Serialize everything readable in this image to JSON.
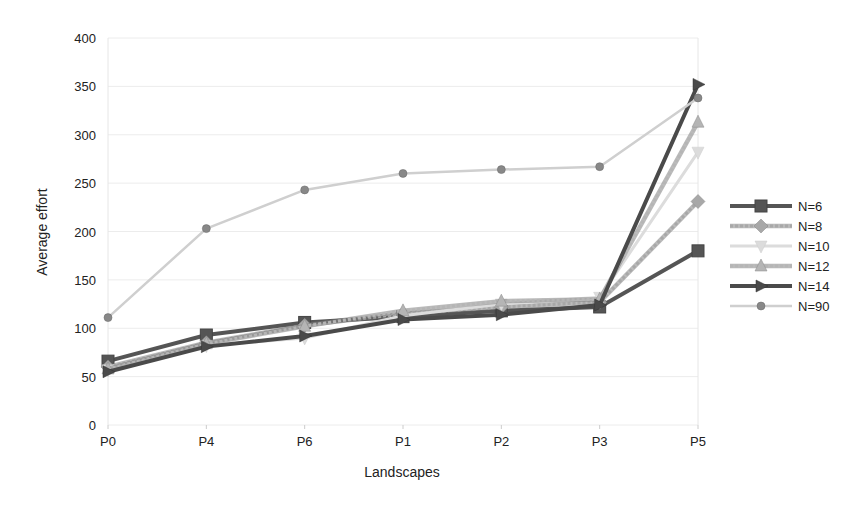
{
  "chart_data": {
    "type": "line",
    "title": "",
    "xlabel": "Landscapes",
    "ylabel": "Average effort",
    "categories": [
      "P0",
      "P4",
      "P6",
      "P1",
      "P2",
      "P3",
      "P5"
    ],
    "ylim": [
      0,
      400
    ],
    "yticks": [
      0,
      50,
      100,
      150,
      200,
      250,
      300,
      350,
      400
    ],
    "grid": true,
    "legend_position": "right",
    "series": [
      {
        "name": "N=6",
        "values": [
          66,
          93,
          106,
          112,
          118,
          122,
          180
        ],
        "color": "#555555",
        "dash": "",
        "width": 4,
        "marker": "square"
      },
      {
        "name": "N=8",
        "values": [
          60,
          85,
          103,
          115,
          122,
          127,
          231
        ],
        "color": "#a8a8a8",
        "dash": "3,2",
        "width": 3,
        "marker": "diamond"
      },
      {
        "name": "N=10",
        "values": [
          57,
          82,
          90,
          113,
          125,
          132,
          282
        ],
        "color": "#dcdcdc",
        "dash": "",
        "width": 3,
        "marker": "triangle-down"
      },
      {
        "name": "N=12",
        "values": [
          58,
          84,
          102,
          118,
          128,
          130,
          313
        ],
        "color": "#b5b5b5",
        "dash": "3,2",
        "width": 3,
        "marker": "triangle-up"
      },
      {
        "name": "N=14",
        "values": [
          55,
          81,
          92,
          109,
          114,
          124,
          352
        ],
        "color": "#4a4a4a",
        "dash": "",
        "width": 4,
        "marker": "triangle-right"
      },
      {
        "name": "N=90",
        "values": [
          111,
          203,
          243,
          260,
          264,
          267,
          338
        ],
        "color": "#cfcfcf",
        "dash": "",
        "width": 2.5,
        "marker": "circle"
      }
    ]
  }
}
